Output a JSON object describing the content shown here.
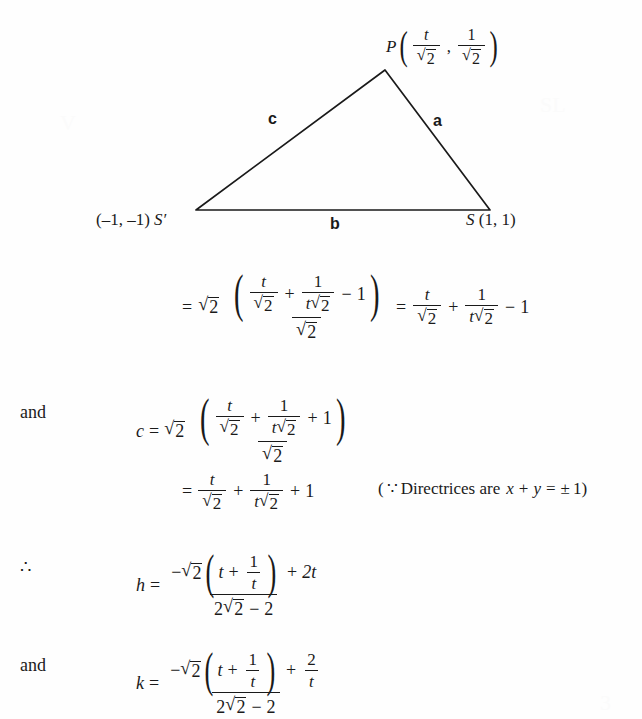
{
  "document": {
    "type": "math-derivation-page",
    "background": "#fefefe",
    "ink": "#1a1a1a"
  },
  "diagram": {
    "name": "triangle-PSS-prime",
    "apex_label_point": "P",
    "apex_coord_x_num": "t",
    "apex_coord_x_den": "2",
    "apex_coord_y_num": "1",
    "apex_coord_y_den": "2",
    "comma": ",",
    "left_vertex_coord": "(–1, –1)",
    "left_vertex_name": "S′",
    "right_vertex_name": "S",
    "right_vertex_coord": "(1, 1)",
    "side_a": "a",
    "side_b": "b",
    "side_c": "c",
    "vertices": {
      "apex": [
        385,
        70
      ],
      "left": [
        196,
        210
      ],
      "right": [
        490,
        210
      ]
    }
  },
  "lines": {
    "line1": {
      "lead": "=",
      "factor_radicand": "2",
      "numerator": {
        "t1_num": "t",
        "t1_den": "2",
        "plus": "+",
        "t2_num": "1",
        "t2_den_t": "t",
        "t2_den_rad": "2",
        "minus": "−",
        "one": "1"
      },
      "denominator_radicand": "2",
      "equals": "=",
      "result": {
        "t1_num": "t",
        "t1_den": "2",
        "plus": "+",
        "t2_num": "1",
        "t2_den_t": "t",
        "t2_den_rad": "2",
        "minus": "−",
        "one": "1"
      }
    },
    "line2": {
      "lead": "and",
      "var": "c",
      "equals": "=",
      "factor_radicand": "2",
      "numerator": {
        "t1_num": "t",
        "t1_den": "2",
        "plus": "+",
        "t2_num": "1",
        "t2_den_t": "t",
        "t2_den_rad": "2",
        "plus2": "+",
        "one": "1"
      },
      "denominator_radicand": "2"
    },
    "line3": {
      "lead": "=",
      "t1_num": "t",
      "t1_den": "2",
      "plus": "+",
      "t2_num": "1",
      "t2_den_t": "t",
      "t2_den_rad": "2",
      "plus2": "+",
      "one": "1",
      "note": {
        "open": "(",
        "because": "∵",
        "text": "Directrices are",
        "x": "x",
        "plus": "+",
        "y": "y",
        "equals": "=",
        "pm": "±",
        "one": "1",
        "close": ")"
      }
    },
    "line4": {
      "lead": "∴",
      "var": "h",
      "equals": "=",
      "num_minus": "−",
      "num_radicand": "2",
      "inner_t": "t",
      "inner_plus": "+",
      "inner_frac_num": "1",
      "inner_frac_den": "t",
      "tail_plus": "+",
      "tail_term": "2t",
      "den_coef": "2",
      "den_radicand": "2",
      "den_minus": "−",
      "den_const": "2"
    },
    "line5": {
      "lead": "and",
      "var": "k",
      "equals": "=",
      "num_minus": "−",
      "num_radicand": "2",
      "inner_t": "t",
      "inner_plus": "+",
      "inner_frac_num": "1",
      "inner_frac_den": "t",
      "tail_plus": "+",
      "tail_frac_num": "2",
      "tail_frac_den": "t",
      "den_coef": "2",
      "den_radicand": "2",
      "den_minus": "−",
      "den_const": "2"
    }
  }
}
